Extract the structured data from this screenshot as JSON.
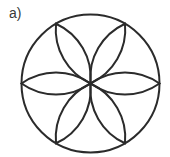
{
  "figure": {
    "label": "a)",
    "stroke_color": "#2b2b2b",
    "circle": {
      "cx": 90.5,
      "cy": 83.5,
      "r": 69
    },
    "petal_angles_deg": [
      0,
      60,
      120,
      180,
      240,
      300
    ],
    "petal_half_width": 11
  }
}
